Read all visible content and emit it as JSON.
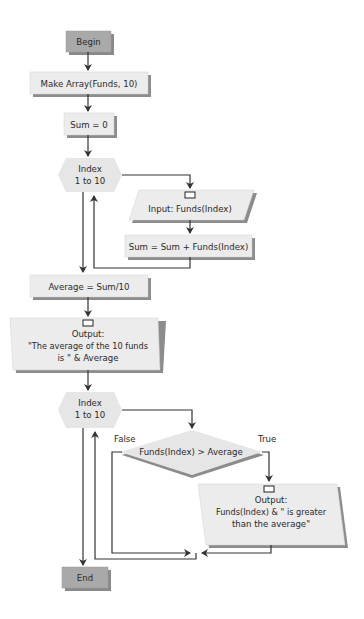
{
  "diagram": {
    "type": "flowchart",
    "colors": {
      "terminal_fill": "#a9a9a9",
      "process_fill": "#ececec",
      "shadow": "#8c8c8c",
      "line": "#3a3a3a",
      "background": "#ffffff"
    },
    "nodes": {
      "begin": {
        "label": "Begin",
        "shape": "terminal"
      },
      "make_array": {
        "label": "Make Array(Funds, 10)",
        "shape": "process"
      },
      "sum_init": {
        "label": "Sum = 0",
        "shape": "process"
      },
      "loop1": {
        "line1": "Index",
        "line2": "1 to 10",
        "shape": "loop-hexagon"
      },
      "input": {
        "label": "Input: Funds(Index)",
        "shape": "io-parallelogram"
      },
      "sum_add": {
        "label": "Sum = Sum + Funds(Index)",
        "shape": "process"
      },
      "average": {
        "label": "Average = Sum/10",
        "shape": "process"
      },
      "output1": {
        "line1": "Output:",
        "line2": "\"The average of the 10 funds",
        "line3": "is \" & Average",
        "shape": "io-parallelogram"
      },
      "loop2": {
        "line1": "Index",
        "line2": "1 to 10",
        "shape": "loop-hexagon"
      },
      "decision": {
        "label": "Funds(Index) > Average",
        "shape": "decision"
      },
      "output2": {
        "line1": "Output:",
        "line2": "Funds(Index) & \" is greater",
        "line3": "than the average\"",
        "shape": "io-parallelogram"
      },
      "end": {
        "label": "End",
        "shape": "terminal"
      }
    },
    "branch_labels": {
      "false": "False",
      "true": "True"
    }
  }
}
